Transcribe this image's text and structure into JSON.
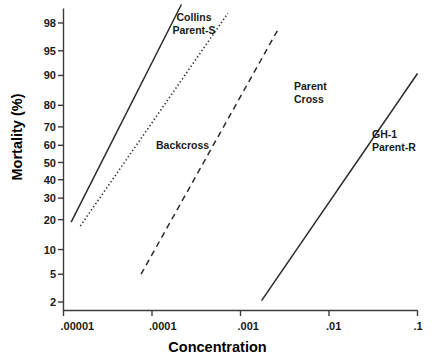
{
  "chart_data": {
    "type": "line",
    "title": "",
    "xlabel": "Concentration",
    "ylabel": "Mortality (%)",
    "scale": {
      "x": "log10",
      "y": "probit"
    },
    "xlim": [
      1e-05,
      0.1
    ],
    "ylim": [
      2,
      99
    ],
    "grid": false,
    "legend_position": "inline-annotations",
    "xticks": [
      {
        "value": 1e-05,
        "label": ".00001"
      },
      {
        "value": 0.0001,
        "label": ".0001"
      },
      {
        "value": 0.001,
        "label": ".001"
      },
      {
        "value": 0.01,
        "label": ".01"
      },
      {
        "value": 0.1,
        "label": ".1"
      }
    ],
    "yticks": [
      {
        "value": 98,
        "label": "98"
      },
      {
        "value": 95,
        "label": "95"
      },
      {
        "value": 90,
        "label": "90"
      },
      {
        "value": 80,
        "label": "80"
      },
      {
        "value": 70,
        "label": "70"
      },
      {
        "value": 60,
        "label": "60"
      },
      {
        "value": 50,
        "label": "50"
      },
      {
        "value": 40,
        "label": "40"
      },
      {
        "value": 30,
        "label": "30"
      },
      {
        "value": 20,
        "label": "20"
      },
      {
        "value": 10,
        "label": "10"
      },
      {
        "value": 5,
        "label": "5"
      },
      {
        "value": 2,
        "label": "2"
      }
    ],
    "series": [
      {
        "name": "Collins Parent-S",
        "label": "Collins\nParent-S",
        "style": "solid",
        "color": "#2b2b2b",
        "points": [
          {
            "x": 1.22e-05,
            "y": 19
          },
          {
            "x": 0.000215,
            "y": 99
          }
        ]
      },
      {
        "name": "Backcross",
        "label": "Backcross",
        "style": "dotted",
        "color": "#2b2b2b",
        "points": [
          {
            "x": 1.55e-05,
            "y": 17.5
          },
          {
            "x": 0.00072,
            "y": 98.6
          }
        ]
      },
      {
        "name": "Parent Cross",
        "label": "Parent\nCross",
        "style": "dashed",
        "color": "#2b2b2b",
        "points": [
          {
            "x": 7.52e-05,
            "y": 5
          },
          {
            "x": 0.00266,
            "y": 97.5
          }
        ]
      },
      {
        "name": "GH-1 Parent-R",
        "label": "GH-1\nParent-R",
        "style": "solid",
        "color": "#2b2b2b",
        "points": [
          {
            "x": 0.00173,
            "y": 2.1
          },
          {
            "x": 0.1,
            "y": 90.5
          }
        ]
      }
    ]
  }
}
